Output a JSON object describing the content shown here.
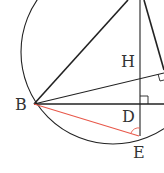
{
  "diagram": {
    "type": "geometry",
    "labels": {
      "B": "B",
      "H": "H",
      "D": "D",
      "E": "E"
    },
    "colors": {
      "stroke": "#222222",
      "highlight": "#e8584a",
      "text": "#333333"
    },
    "elements": [
      "circle",
      "segment A-B",
      "segment A-E (altitude through H, D)",
      "segment A-C",
      "segment B-H (extended, perpendicular to AC)",
      "segment B-D (BC)",
      "segment B-E (red)",
      "right-angle mark at D",
      "right-angle mark on AC",
      "angle arc at E"
    ]
  }
}
